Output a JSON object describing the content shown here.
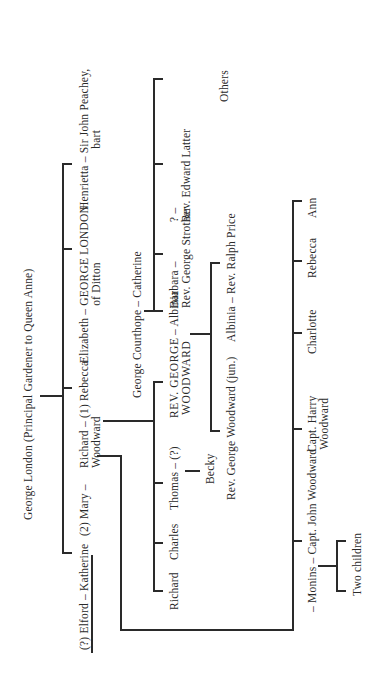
{
  "root": {
    "label": "George London (Principal Gardener to Queen Anne)"
  },
  "generation1": [
    {
      "id": "henrietta",
      "line1": "Henrietta – Sir John Peachey,",
      "line2": "bart"
    },
    {
      "id": "elizabeth",
      "line1": "Elizabeth – GEORGE LONDON",
      "line2": "of Ditton"
    },
    {
      "id": "rebecca",
      "line1": "Richard – (1) Rebecca",
      "line2": "Woodward"
    },
    {
      "id": "mary",
      "line1": "(2) Mary –"
    },
    {
      "id": "katherine",
      "line1": "(?) Elford – Katherine"
    }
  ],
  "courthope": {
    "parents": "George Courthope – Catherine",
    "children": [
      {
        "id": "albinia",
        "line1": "– Albinia"
      },
      {
        "id": "barbara",
        "line1": "Barbara –",
        "line2": "Rev. George Strother"
      },
      {
        "id": "latter",
        "line1": "? –",
        "line2": "Rev. Edward Latter"
      },
      {
        "id": "others",
        "line1": "Others"
      }
    ]
  },
  "woodward_children_rebecca": [
    {
      "id": "rev-george",
      "line1": "REV. GEORGE",
      "line2": "WOODWARD"
    },
    {
      "id": "thomas",
      "line1": "Thomas – (?)"
    },
    {
      "id": "charles",
      "line1": "Charles"
    },
    {
      "id": "richard",
      "line1": "Richard"
    }
  ],
  "becky": {
    "label": "Becky"
  },
  "rev_george_children": [
    {
      "id": "albinia-price",
      "line1": "Albinia – Rev. Ralph Price"
    },
    {
      "id": "george-jun",
      "line1": "Rev. George Woodward (jun.)"
    }
  ],
  "woodward_children_mary": [
    {
      "id": "ann",
      "line1": "Ann"
    },
    {
      "id": "rebecca2",
      "line1": "Rebecca"
    },
    {
      "id": "charlotte",
      "line1": "Charlotte"
    },
    {
      "id": "harry",
      "line1": "Capt. Harry",
      "line2": "Woodward"
    },
    {
      "id": "john",
      "line1": "– Monins – Capt. John Woodward"
    }
  ],
  "two_children": {
    "label": "Two children"
  }
}
